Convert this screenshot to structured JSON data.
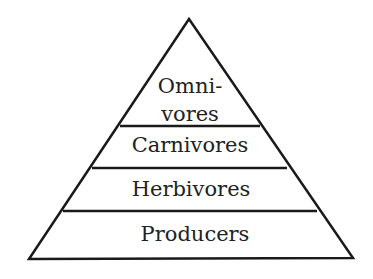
{
  "diagram": {
    "type": "pyramid",
    "title": "",
    "line_color": "#1a1a1a",
    "text_color": "#222222",
    "levels": [
      {
        "label_line1": "Omni-",
        "label_line2": "vores",
        "full_label": "Omnivores"
      },
      {
        "label": "Carnivores"
      },
      {
        "label": "Herbivores"
      },
      {
        "label": "Producers"
      }
    ]
  }
}
